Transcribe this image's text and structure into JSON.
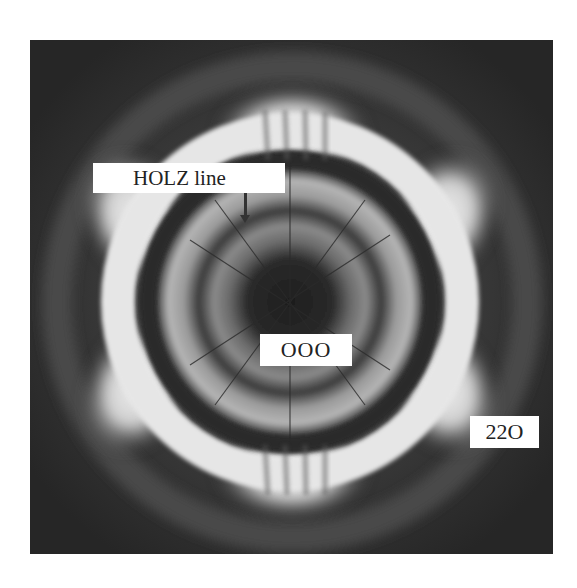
{
  "figure": {
    "labels": {
      "holz_line": "HOLZ line",
      "center_disc": "OOO",
      "outer_disc": "22O"
    }
  }
}
